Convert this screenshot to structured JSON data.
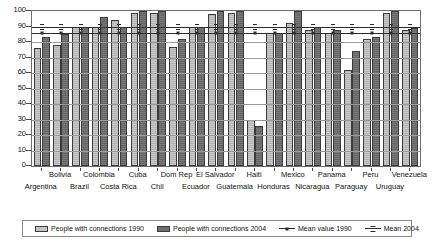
{
  "chart_data": {
    "type": "bar",
    "title": "",
    "xlabel": "",
    "ylabel": "",
    "ylim": [
      0,
      100
    ],
    "yticks": [
      0,
      10,
      20,
      30,
      40,
      50,
      60,
      70,
      80,
      90,
      100
    ],
    "grid": true,
    "legend_position": "bottom",
    "categories": [
      "Argentina",
      "Bolivia",
      "Brazil",
      "Colombia",
      "Costa Rica",
      "Cuba",
      "Chil",
      "Dom Rep",
      "Ecuador",
      "El Salvador",
      "Guatemala",
      "Haiti",
      "Honduras",
      "Mexico",
      "Nicaragua",
      "Panama",
      "Paraguay",
      "Peru",
      "Uruguay",
      "Venezuela"
    ],
    "series": [
      {
        "name": "People with connections 1990",
        "color": "#bdbdbd",
        "values": [
          76,
          78,
          90,
          90,
          94,
          99,
          99,
          77,
          90,
          98,
          99,
          30,
          86,
          92,
          88,
          86,
          62,
          82,
          99,
          88
        ]
      },
      {
        "name": "People with connections 2004",
        "color": "#6f6f6f",
        "values": [
          83,
          85,
          90,
          96,
          90,
          100,
          100,
          82,
          90,
          100,
          100,
          26,
          86,
          100,
          90,
          88,
          74,
          83,
          100,
          89
        ]
      }
    ],
    "reference_lines": [
      {
        "name": "Mean value 1990",
        "value": 86,
        "style": "line-marker"
      },
      {
        "name": "Mean 2004",
        "value": 90,
        "style": "line-marker"
      }
    ]
  },
  "legend": {
    "items": [
      {
        "label": "People with connections 1990",
        "type": "swatch-1990"
      },
      {
        "label": "People with connections 2004",
        "type": "swatch-2004"
      },
      {
        "label": "Mean value 1990",
        "type": "line-1990"
      },
      {
        "label": "Mean 2004",
        "type": "line-2004"
      }
    ]
  }
}
